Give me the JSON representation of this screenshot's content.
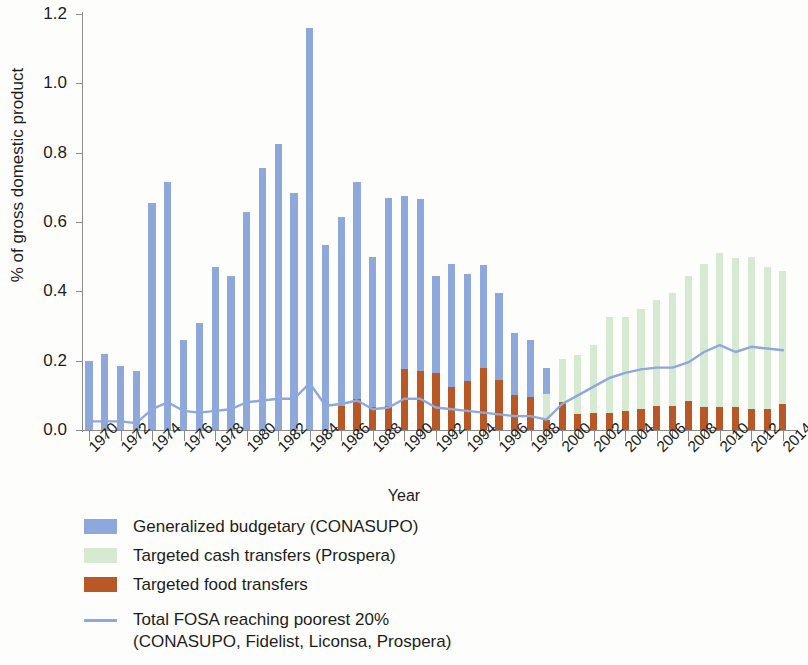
{
  "chart_data": {
    "type": "bar",
    "title": "",
    "xlabel": "Year",
    "ylabel": "% of gross domestic product",
    "ylim": [
      0.0,
      1.2
    ],
    "ytick_labels": [
      "0.0",
      "0.2",
      "0.4",
      "0.6",
      "0.8",
      "1.0",
      "1.2"
    ],
    "ytick_values": [
      0.0,
      0.2,
      0.4,
      0.6,
      0.8,
      1.0,
      1.2
    ],
    "grid": false,
    "legend_position": "below-axes",
    "x": [
      1970,
      1971,
      1972,
      1973,
      1974,
      1975,
      1976,
      1977,
      1978,
      1979,
      1980,
      1981,
      1982,
      1983,
      1984,
      1985,
      1986,
      1987,
      1988,
      1989,
      1990,
      1991,
      1992,
      1993,
      1994,
      1995,
      1996,
      1997,
      1998,
      1999,
      2000,
      2001,
      2002,
      2003,
      2004,
      2005,
      2006,
      2007,
      2008,
      2009,
      2010,
      2011,
      2012,
      2013,
      2014
    ],
    "xtick_labels": [
      "1970",
      "1972",
      "1974",
      "1976",
      "1978",
      "1980",
      "1982",
      "1984",
      "1986",
      "1988",
      "1990",
      "1992",
      "1994",
      "1996",
      "1998",
      "2000",
      "2002",
      "2004",
      "2006",
      "2008",
      "2010",
      "2012",
      "2014"
    ],
    "xtick_values": [
      1970,
      1972,
      1974,
      1976,
      1978,
      1980,
      1982,
      1984,
      1986,
      1988,
      1990,
      1992,
      1994,
      1996,
      1998,
      2000,
      2002,
      2004,
      2006,
      2008,
      2010,
      2012,
      2014
    ],
    "stacked": true,
    "series": [
      {
        "name": "Generalized budgetary  (CONASUPO)",
        "key": "generalized_budgetary",
        "color": "#8fa8dc",
        "values": [
          0.2,
          0.22,
          0.185,
          0.17,
          0.655,
          0.715,
          0.26,
          0.31,
          0.47,
          0.445,
          0.63,
          0.755,
          0.825,
          0.685,
          1.16,
          0.535,
          0.545,
          0.625,
          0.435,
          0.6,
          0.5,
          0.495,
          0.28,
          0.355,
          0.31,
          0.295,
          0.25,
          0.18,
          0.165,
          0.075,
          0.0,
          0.0,
          0.0,
          0.0,
          0.0,
          0.0,
          0.0,
          0.0,
          0.0,
          0.0,
          0.0,
          0.0,
          0.0,
          0.0,
          0.0
        ]
      },
      {
        "name": "Targeted cash transfers (Prospera)",
        "key": "targeted_cash_transfers",
        "color": "#d6ead1",
        "values": [
          0,
          0,
          0,
          0,
          0,
          0,
          0,
          0,
          0,
          0,
          0,
          0,
          0,
          0,
          0,
          0,
          0,
          0,
          0,
          0,
          0,
          0,
          0,
          0,
          0,
          0,
          0,
          0,
          0,
          0.075,
          0.125,
          0.17,
          0.195,
          0.275,
          0.27,
          0.29,
          0.305,
          0.325,
          0.36,
          0.415,
          0.445,
          0.43,
          0.44,
          0.41,
          0.385
        ]
      },
      {
        "name": "Targeted food transfers",
        "key": "targeted_food_transfers",
        "color": "#b85827",
        "values": [
          0,
          0,
          0,
          0,
          0,
          0,
          0,
          0,
          0,
          0,
          0,
          0,
          0,
          0,
          0,
          0,
          0.07,
          0.09,
          0.065,
          0.07,
          0.175,
          0.17,
          0.165,
          0.125,
          0.14,
          0.18,
          0.145,
          0.1,
          0.095,
          0.03,
          0.08,
          0.045,
          0.05,
          0.05,
          0.055,
          0.06,
          0.07,
          0.07,
          0.085,
          0.065,
          0.065,
          0.065,
          0.06,
          0.06,
          0.075
        ]
      }
    ],
    "line_series": {
      "name": "Total FOSA reaching poorest 20%",
      "name_line2": "(CONASUPO, Fidelist, Liconsa, Prospera)",
      "key": "total_fosa_poorest20",
      "color": "#8fa8dc",
      "values": [
        0.025,
        0.025,
        0.025,
        0.02,
        0.06,
        0.08,
        0.055,
        0.05,
        0.055,
        0.06,
        0.08,
        0.085,
        0.09,
        0.09,
        0.135,
        0.07,
        0.075,
        0.085,
        0.06,
        0.065,
        0.09,
        0.09,
        0.065,
        0.06,
        0.055,
        0.05,
        0.045,
        0.04,
        0.04,
        0.03,
        0.075,
        0.1,
        0.125,
        0.15,
        0.165,
        0.175,
        0.18,
        0.18,
        0.195,
        0.225,
        0.245,
        0.225,
        0.24,
        0.235,
        0.23
      ]
    }
  },
  "axes": {
    "y_title": "% of gross domestic product",
    "x_title": "Year"
  },
  "legend": {
    "items": [
      {
        "label": "Generalized budgetary  (CONASUPO)",
        "swatch": "legend-swatch-blue",
        "color": "#8fa8dc"
      },
      {
        "label": "Targeted cash transfers (Prospera)",
        "swatch": "legend-swatch-green",
        "color": "#d6ead1"
      },
      {
        "label": "Targeted food transfers",
        "swatch": "legend-swatch-brown",
        "color": "#b85827"
      }
    ],
    "line_item": {
      "label_line1": "Total FOSA reaching poorest 20%",
      "label_line2": "(CONASUPO, Fidelist, Liconsa, Prospera)",
      "color": "#8fa8dc"
    }
  }
}
